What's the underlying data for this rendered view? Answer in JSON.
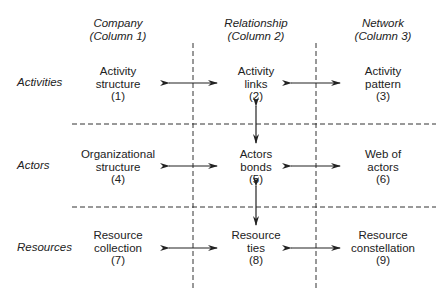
{
  "columns": [
    {
      "title": "Company",
      "sub": "(Column 1)"
    },
    {
      "title": "Relationship",
      "sub": "(Column 2)"
    },
    {
      "title": "Network",
      "sub": "(Column 3)"
    }
  ],
  "rows": [
    "Activities",
    "Actors",
    "Resources"
  ],
  "cells": [
    {
      "l1": "Activity",
      "l2": "structure",
      "n": "(1)"
    },
    {
      "l1": "Activity",
      "l2": "links",
      "n": "(2)"
    },
    {
      "l1": "Activity",
      "l2": "pattern",
      "n": "(3)"
    },
    {
      "l1": "Organizational",
      "l2": "structure",
      "n": "(4)"
    },
    {
      "l1": "Actors",
      "l2": "bonds",
      "n": "(5)"
    },
    {
      "l1": "Web of",
      "l2": "actors",
      "n": "(6)"
    },
    {
      "l1": "Resource",
      "l2": "collection",
      "n": "(7)"
    },
    {
      "l1": "Resource",
      "l2": "ties",
      "n": "(8)"
    },
    {
      "l1": "Resource",
      "l2": "constellation",
      "n": "(9)"
    }
  ]
}
